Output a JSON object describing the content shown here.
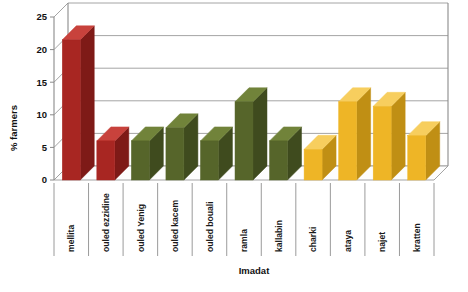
{
  "chart_data": {
    "type": "bar",
    "title": "",
    "xlabel": "Imadat",
    "ylabel": "% farmers",
    "ylim": [
      0,
      25
    ],
    "yticks": [
      0,
      5,
      10,
      15,
      20,
      25
    ],
    "grid": true,
    "legend": "none",
    "style": "3d-column",
    "categories": [
      "mellita",
      "ouled ezzidine",
      "ouled Yenig",
      "ouled kacem",
      "ouled bouali",
      "ramla",
      "kallabin",
      "charki",
      "ataya",
      "najet",
      "kratten"
    ],
    "values": [
      21.5,
      6.0,
      6.0,
      8.0,
      6.0,
      12.0,
      6.0,
      4.7,
      12.0,
      11.3,
      6.8
    ],
    "bar_colors": [
      "#a82622",
      "#a82622",
      "#56652a",
      "#56652a",
      "#56652a",
      "#56652a",
      "#56652a",
      "#eeb526",
      "#eeb526",
      "#eeb526",
      "#eeb526"
    ],
    "color_groups": [
      {
        "name": "group-red",
        "color": "#a82622",
        "categories": [
          "mellita",
          "ouled ezzidine"
        ]
      },
      {
        "name": "group-green",
        "color": "#56652a",
        "categories": [
          "ouled Yenig",
          "ouled kacem",
          "ouled bouali",
          "ramla",
          "kallabin"
        ]
      },
      {
        "name": "group-amber",
        "color": "#eeb526",
        "categories": [
          "charki",
          "ataya",
          "najet",
          "kratten"
        ]
      }
    ]
  },
  "axis": {
    "y_title": "% farmers",
    "x_title": "Imadat",
    "tick_labels": [
      "0",
      "5",
      "10",
      "15",
      "20",
      "25"
    ]
  },
  "colors": {
    "red": "#a82622",
    "red_top": "#c8423c",
    "red_side": "#7e1a17",
    "green": "#56652a",
    "green_top": "#71833a",
    "green_side": "#3f4b1e",
    "amber": "#eeb526",
    "amber_top": "#f7ce5e",
    "amber_side": "#c08f14",
    "grid": "#9a9a9a",
    "axis": "#8a8a8a",
    "text": "#111111",
    "background": "#ffffff"
  }
}
